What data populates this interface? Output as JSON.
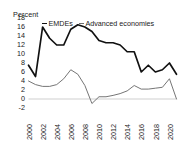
{
  "axis_unit_label": "Percent",
  "legend": {
    "items": [
      {
        "label": "EMDEs",
        "color": "#111111"
      },
      {
        "label": "Advanced economies",
        "color": "#6e6e6e"
      }
    ]
  },
  "chart_data": {
    "type": "line",
    "title": "",
    "subtitle": "",
    "xlabel": "",
    "ylabel": "Percent",
    "xlim": [
      2000,
      2021
    ],
    "ylim": [
      -2,
      18
    ],
    "grid": false,
    "legend_position": "top",
    "yticks": [
      18,
      16,
      14,
      12,
      10,
      8,
      6,
      4,
      2,
      0,
      -2
    ],
    "ytick_labels": [
      "18",
      "16",
      "14",
      "12",
      "10",
      "8",
      "6",
      "4",
      "2",
      "0",
      "-2"
    ],
    "xticks": [
      2000,
      2002,
      2004,
      2006,
      2008,
      2010,
      2012,
      2014,
      2016,
      2018,
      2020
    ],
    "xtick_labels": [
      "2000",
      "2002",
      "2004",
      "2006",
      "2008",
      "2010",
      "2012",
      "2014",
      "2016",
      "2018",
      "2020"
    ],
    "x": [
      2000,
      2001,
      2002,
      2003,
      2004,
      2005,
      2006,
      2007,
      2008,
      2009,
      2010,
      2011,
      2012,
      2013,
      2014,
      2015,
      2016,
      2017,
      2018,
      2019,
      2020,
      2021
    ],
    "series": [
      {
        "name": "EMDEs",
        "color": "#111111",
        "values": [
          7.5,
          5.0,
          16.0,
          13.5,
          12.0,
          12.0,
          15.5,
          16.5,
          16.0,
          15.0,
          13.0,
          12.5,
          12.5,
          12.0,
          10.5,
          10.5,
          6.0,
          7.5,
          6.0,
          6.5,
          8.0,
          5.5
        ]
      },
      {
        "name": "Advanced economies",
        "color": "#6e6e6e",
        "values": [
          4.0,
          3.2,
          2.8,
          2.8,
          3.2,
          4.5,
          6.5,
          5.5,
          3.0,
          -1.0,
          0.5,
          0.5,
          0.8,
          1.2,
          1.8,
          3.0,
          2.2,
          2.2,
          2.4,
          2.6,
          4.5,
          0.0
        ]
      }
    ],
    "zero_line": 0
  }
}
